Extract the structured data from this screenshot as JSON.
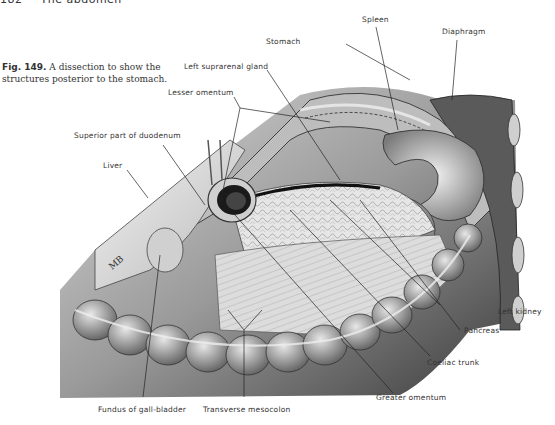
{
  "running_head": {
    "page_number": "182",
    "section": "The abdomen"
  },
  "figure": {
    "number": "Fig. 149.",
    "caption": "A dissection to show the structures posterior to the stomach.",
    "artist_monogram": "MB"
  },
  "labels": {
    "spleen": "Spleen",
    "diaphragm": "Diaphragm",
    "stomach": "Stomach",
    "left_suprarenal_gland": "Left suprarenal gland",
    "lesser_omentum": "Lesser omentum",
    "superior_part_of_duodenum": "Superior part of duodenum",
    "liver": "Liver",
    "left_kidney": "Left kidney",
    "pancreas": "Pancreas",
    "coeliac_trunk": "Coeliac trunk",
    "greater_omentum": "Greater omentum",
    "fundus_of_gall_bladder": "Fundus of gall-bladder",
    "transverse_mesocolon": "Transverse mesocolon"
  }
}
